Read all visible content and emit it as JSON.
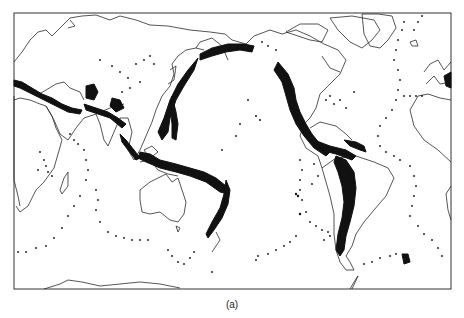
{
  "figure": {
    "caption": "(a)",
    "colors": {
      "coastline": "#2a2a2a",
      "epicenter": "#111111",
      "frame": "#333333",
      "background": "#ffffff"
    }
  }
}
